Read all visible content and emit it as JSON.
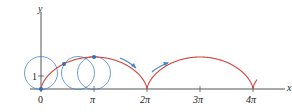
{
  "diagram": {
    "type": "cycloid",
    "axes": {
      "x_label": "x",
      "y_label": "y",
      "x_ticks": [
        "0",
        "π",
        "2π",
        "3π",
        "4π"
      ],
      "y_ticks": [
        "1"
      ]
    },
    "colors": {
      "curve": "#d0423a",
      "circles": "#4a86c8",
      "arrows": "#3f88c8",
      "axes": "#555555",
      "points": "#2f6fb8"
    },
    "curve_label": "cycloid x = r(θ − sin θ), y = r(1 − cos θ), r = 1",
    "circle_count": 3,
    "arrow_count": 2
  }
}
